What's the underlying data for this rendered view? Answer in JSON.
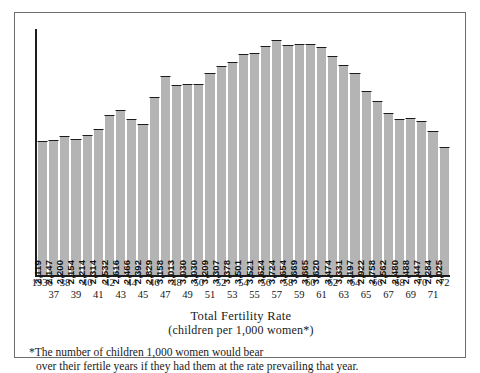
{
  "chart_data": {
    "type": "bar",
    "title": "Total Fertility Rate",
    "subtitle": "(children per 1,000 women*)",
    "xlabel": "",
    "ylabel": "",
    "grid": false,
    "legend": "none",
    "ylim": [
      0,
      3900
    ],
    "categories": [
      "1936",
      "1937",
      "1938",
      "1939",
      "1940",
      "1941",
      "1942",
      "1943",
      "1944",
      "1945",
      "1946",
      "1947",
      "1948",
      "1949",
      "1950",
      "1951",
      "1952",
      "1953",
      "1954",
      "1955",
      "1956",
      "1957",
      "1958",
      "1959",
      "1960",
      "1961",
      "1962",
      "1963",
      "1964",
      "1965",
      "1966",
      "1967",
      "1968",
      "1969",
      "1970",
      "1971",
      "1972"
    ],
    "values": [
      2119,
      2147,
      2200,
      2154,
      2214,
      2314,
      2532,
      2616,
      2466,
      2392,
      2829,
      3158,
      3013,
      3030,
      3030,
      3209,
      3307,
      3378,
      3501,
      3521,
      3624,
      3724,
      3654,
      3669,
      3665,
      3620,
      3474,
      3331,
      3197,
      2922,
      2758,
      2562,
      2480,
      2488,
      2447,
      2284,
      2025
    ],
    "value_labels": [
      "2,119",
      "2,147",
      "2,200",
      "2,154",
      "2,214",
      "2,314",
      "2,532",
      "2,616",
      "2,466",
      "2,392",
      "2,829",
      "3,158",
      "3,013",
      "3,030",
      "3,030",
      "3,209",
      "3,307",
      "3,378",
      "3,501",
      "3,521",
      "3,624",
      "3,724",
      "3,654",
      "3,669",
      "3,665",
      "3,620",
      "3,474",
      "3,331",
      "3,197",
      "2,922",
      "2,758",
      "2,562",
      "2,480",
      "2,488",
      "2,447",
      "2,284",
      "2,025"
    ],
    "tick_labels": [
      "1936",
      "37",
      "38",
      "39",
      "40",
      "41",
      "42",
      "43",
      "44",
      "45",
      "46",
      "47",
      "48",
      "49",
      "50",
      "51",
      "52",
      "53",
      "54",
      "55",
      "56",
      "57",
      "58",
      "59",
      "60",
      "61",
      "62",
      "63",
      "64",
      "65",
      "66",
      "67",
      "68",
      "69",
      "70",
      "71",
      "72"
    ],
    "bar_color": "#b4b4b4",
    "outline_color": "#1c1c1c"
  },
  "footnote": {
    "line1": "*The number of children 1,000 women would bear",
    "line2": "over their fertile years if they had them at  the rate prevailing that year."
  }
}
